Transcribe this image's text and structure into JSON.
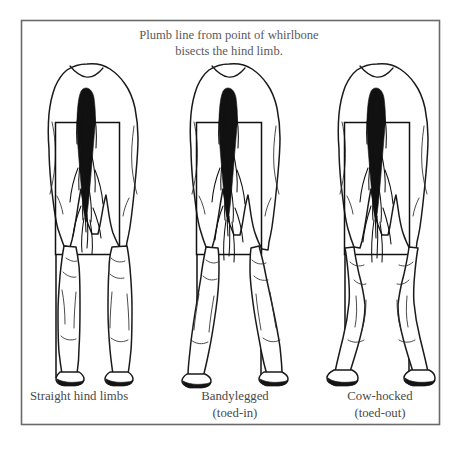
{
  "plate": {
    "title_line1": "Plumb line from point of whirlbone",
    "title_line2": "bisects the hind limb.",
    "border_color": "#6a6a6a",
    "background_color": "#ffffff",
    "ink_color": "#111111"
  },
  "figures": [
    {
      "id": "straight-hind-limbs",
      "caption_line1": "Straight hind limbs",
      "caption_line2": "",
      "caption_align": "left",
      "description": "rear view of horse hindquarters with vertical plumb lines bisecting each hind limb"
    },
    {
      "id": "bandylegged",
      "caption_line1": "Bandylegged",
      "caption_line2": "(toed-in)",
      "caption_align": "center",
      "description": "rear view of horse hindquarters with hocks set wide and hooves turned inward"
    },
    {
      "id": "cow-hocked",
      "caption_line1": "Cow-hocked",
      "caption_line2": "(toed-out)",
      "caption_align": "center",
      "description": "rear view of horse hindquarters with hocks turned inward and hooves turned outward"
    }
  ]
}
